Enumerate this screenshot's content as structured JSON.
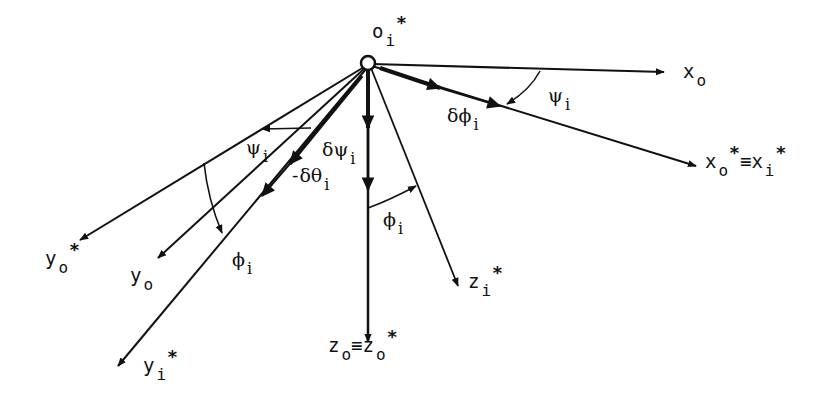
{
  "diagram": {
    "title": "",
    "origin": {
      "label": "o",
      "subscript": "i",
      "superscript": "*"
    },
    "axes": [
      {
        "id": "x_o",
        "label": "x",
        "subscript": "o",
        "superscript": ""
      },
      {
        "id": "x_o_star_eq_x_i_star",
        "label": "x",
        "subscript": "o",
        "superscript": "*",
        "equiv": "≡",
        "label2": "x",
        "subscript2": "i",
        "superscript2": "*"
      },
      {
        "id": "y_o_star",
        "label": "y",
        "subscript": "o",
        "superscript": "*"
      },
      {
        "id": "y_o",
        "label": "y",
        "subscript": "o",
        "superscript": ""
      },
      {
        "id": "y_i_star",
        "label": "y",
        "subscript": "i",
        "superscript": "*"
      },
      {
        "id": "z_o_eq_z_o_star",
        "label": "z",
        "subscript": "o",
        "superscript": "",
        "equiv": "≡",
        "label2": "z",
        "subscript2": "o",
        "superscript2": "*"
      },
      {
        "id": "z_i_star",
        "label": "z",
        "subscript": "i",
        "superscript": "*"
      }
    ],
    "angles": [
      {
        "id": "psi_upper",
        "symbol": "ψ",
        "subscript": "i"
      },
      {
        "id": "delta_phi",
        "symbol": "δϕ",
        "subscript": "i"
      },
      {
        "id": "psi_left",
        "symbol": "ψ",
        "subscript": "i"
      },
      {
        "id": "delta_theta",
        "symbol": "δθ",
        "subscript": "i"
      },
      {
        "id": "delta_psi",
        "symbol": "δψ",
        "subscript": "i"
      },
      {
        "id": "phi_mid",
        "symbol": "ϕ",
        "subscript": "i"
      },
      {
        "id": "phi_left",
        "symbol": "ϕ",
        "subscript": "i"
      }
    ],
    "colors": {
      "ink": "#111111",
      "background": "#ffffff"
    }
  }
}
